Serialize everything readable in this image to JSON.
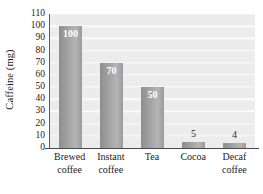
{
  "chart_data": {
    "type": "bar",
    "title": "",
    "subtitle": "",
    "xlabel": "",
    "ylabel": "Caffeine (mg)",
    "categories": [
      "Brewed coffee",
      "Instant coffee",
      "Tea",
      "Cocoa",
      "Decaf coffee"
    ],
    "category_lines": [
      [
        "Brewed",
        "coffee"
      ],
      [
        "Instant",
        "coffee"
      ],
      [
        "Tea"
      ],
      [
        "Cocoa"
      ],
      [
        "Decaf",
        "coffee"
      ]
    ],
    "values": [
      100,
      70,
      50,
      5,
      4
    ],
    "data_labels": [
      "100",
      "70",
      "50",
      "5",
      "4"
    ],
    "label_placement": [
      "inside",
      "inside",
      "inside",
      "above",
      "above"
    ],
    "ylim": [
      0,
      110
    ],
    "ytick_values": [
      0,
      10,
      20,
      30,
      40,
      50,
      60,
      70,
      80,
      90,
      100,
      110
    ],
    "ytick_labels": [
      "0",
      "10",
      "20",
      "30",
      "40",
      "50",
      "60",
      "70",
      "80",
      "90",
      "100",
      "110"
    ],
    "grid": true,
    "grid_orientation": "horizontal",
    "legend": false,
    "legend_position": "none",
    "bar_color": "#a2a2a2",
    "plot_background": "#ececec",
    "gridline_color": "#fbfbfb",
    "axis_color": "#4a4a4a",
    "label_color_inside": "#ffffff",
    "label_color_above": "#2a2a2a"
  }
}
